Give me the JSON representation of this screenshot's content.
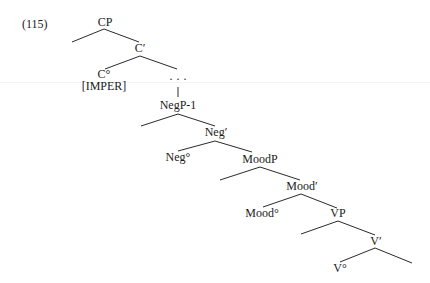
{
  "example_number": "(115)",
  "nodes": [
    {
      "id": "CP",
      "label": "CP",
      "x": 105,
      "y": 22
    },
    {
      "id": "C-bar",
      "label": "C′",
      "x": 140,
      "y": 48
    },
    {
      "id": "C-head",
      "label": "C°",
      "x": 104,
      "y": 74
    },
    {
      "id": "IMPER",
      "label": "[IMPER]",
      "x": 104,
      "y": 86
    },
    {
      "id": "ellipsis",
      "label": "· · ·",
      "x": 178,
      "y": 79
    },
    {
      "id": "NegP-1",
      "label": "NegP-1",
      "x": 178,
      "y": 105
    },
    {
      "id": "Neg-bar",
      "label": "Neg′",
      "x": 216,
      "y": 132
    },
    {
      "id": "Neg-head",
      "label": "Neg°",
      "x": 178,
      "y": 157
    },
    {
      "id": "MoodP",
      "label": "MoodP",
      "x": 260,
      "y": 159
    },
    {
      "id": "Mood-bar",
      "label": "Mood′",
      "x": 302,
      "y": 186
    },
    {
      "id": "Mood-head",
      "label": "Mood°",
      "x": 262,
      "y": 213
    },
    {
      "id": "VP",
      "label": "VP",
      "x": 338,
      "y": 213
    },
    {
      "id": "V-bar",
      "label": "V′",
      "x": 376,
      "y": 241
    },
    {
      "id": "V-head",
      "label": "V°",
      "x": 340,
      "y": 268
    }
  ],
  "edges": [
    {
      "x1": 104,
      "y1": 29,
      "x2": 72,
      "y2": 42
    },
    {
      "x1": 104,
      "y1": 29,
      "x2": 139,
      "y2": 42
    },
    {
      "x1": 140,
      "y1": 56,
      "x2": 105,
      "y2": 69
    },
    {
      "x1": 140,
      "y1": 56,
      "x2": 177,
      "y2": 69
    },
    {
      "x1": 178,
      "y1": 87,
      "x2": 178,
      "y2": 97
    },
    {
      "x1": 178,
      "y1": 114,
      "x2": 141,
      "y2": 126
    },
    {
      "x1": 178,
      "y1": 114,
      "x2": 215,
      "y2": 126
    },
    {
      "x1": 215,
      "y1": 141,
      "x2": 178,
      "y2": 151
    },
    {
      "x1": 215,
      "y1": 141,
      "x2": 252,
      "y2": 152
    },
    {
      "x1": 260,
      "y1": 167,
      "x2": 220,
      "y2": 180
    },
    {
      "x1": 260,
      "y1": 167,
      "x2": 300,
      "y2": 180
    },
    {
      "x1": 301,
      "y1": 194,
      "x2": 263,
      "y2": 207
    },
    {
      "x1": 301,
      "y1": 194,
      "x2": 337,
      "y2": 208
    },
    {
      "x1": 338,
      "y1": 221,
      "x2": 301,
      "y2": 234
    },
    {
      "x1": 338,
      "y1": 221,
      "x2": 375,
      "y2": 235
    },
    {
      "x1": 375,
      "y1": 248,
      "x2": 340,
      "y2": 262
    },
    {
      "x1": 375,
      "y1": 248,
      "x2": 412,
      "y2": 263
    }
  ]
}
